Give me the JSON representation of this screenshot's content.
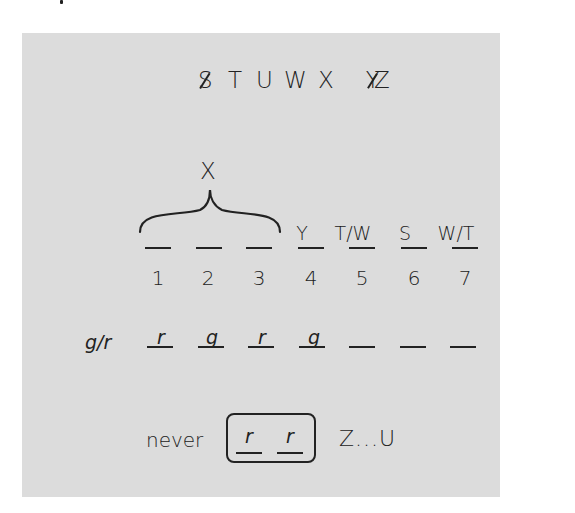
{
  "alphabet_row": {
    "letters": [
      {
        "char": "S",
        "crossed_out": true
      },
      {
        "char": "T",
        "crossed_out": false
      },
      {
        "char": "U",
        "crossed_out": false
      },
      {
        "char": "W",
        "crossed_out": false
      },
      {
        "char": "X",
        "crossed_out": false
      },
      {
        "char": "Y",
        "crossed_out": true
      },
      {
        "char": "Z",
        "crossed_out": false
      }
    ]
  },
  "brace": {
    "label": "X",
    "spans_positions": [
      1,
      2,
      3
    ]
  },
  "slots": {
    "positions": [
      "1",
      "2",
      "3",
      "4",
      "5",
      "6",
      "7"
    ],
    "assignments": [
      "",
      "",
      "",
      "Y",
      "T/W",
      "S",
      "W/T"
    ]
  },
  "gr_row": {
    "label": "g/r",
    "values": [
      "r",
      "g",
      "r",
      "g",
      "",
      "",
      ""
    ]
  },
  "rule": {
    "prefix": "never",
    "boxed_values": [
      "r",
      "r"
    ],
    "suffix": "Z...U"
  }
}
